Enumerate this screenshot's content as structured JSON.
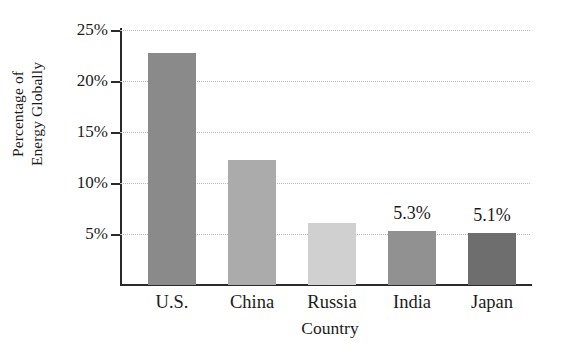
{
  "chart_data": {
    "type": "bar",
    "title": "",
    "xlabel": "Country",
    "ylabel_lines": [
      "Percentage of",
      "Energy Globally"
    ],
    "ylabel": "Percentage of Energy Globally",
    "categories": [
      "U.S.",
      "China",
      "Russia",
      "India",
      "Japan"
    ],
    "values": [
      22.7,
      12.3,
      6.1,
      5.3,
      5.1
    ],
    "value_labels": [
      "",
      "",
      "",
      "5.3%",
      "5.1%"
    ],
    "bar_colors": [
      "#8a8a8a",
      "#ababab",
      "#d0d0d0",
      "#919191",
      "#6e6e6e"
    ],
    "ylim": [
      0,
      25
    ],
    "yticks": [
      5,
      10,
      15,
      20,
      25
    ],
    "ytick_labels": [
      "5%",
      "10%",
      "15%",
      "20%",
      "25%"
    ],
    "grid": true,
    "grid_style": "dotted",
    "legend": "none",
    "axis_color": "#2a2a2a",
    "grid_color": "#b9b9b9",
    "background": "#ffffff"
  }
}
